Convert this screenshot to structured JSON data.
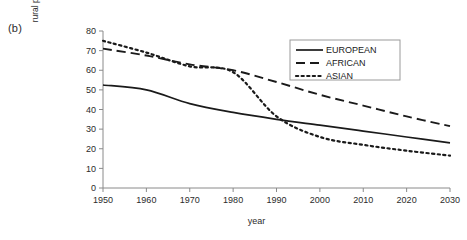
{
  "panel": {
    "label": "(b)"
  },
  "axes": {
    "xlabel": "year",
    "ylabel": "rural population as percentage of total population"
  },
  "legend": {
    "items": [
      {
        "label": "EUROPEAN",
        "style": "solid"
      },
      {
        "label": "AFRICAN",
        "style": "dashed"
      },
      {
        "label": "ASIAN",
        "style": "dotted"
      }
    ]
  },
  "chart_data": {
    "type": "line",
    "title": "",
    "xlabel": "year",
    "ylabel": "rural population as percentage of total population",
    "xlim": [
      1950,
      2030
    ],
    "ylim": [
      0,
      80
    ],
    "xticks": [
      1950,
      1960,
      1970,
      1980,
      1990,
      2000,
      2010,
      2020,
      2030
    ],
    "yticks": [
      0,
      10,
      20,
      30,
      40,
      50,
      60,
      70,
      80
    ],
    "grid": false,
    "legend_position": "top-right",
    "x": [
      1950,
      1960,
      1970,
      1980,
      1990,
      2000,
      2010,
      2020,
      2030
    ],
    "series": [
      {
        "name": "EUROPEAN",
        "style": "solid",
        "color": "#1a1a1a",
        "values": [
          52.5,
          50.0,
          43.0,
          38.5,
          35.0,
          32.0,
          29.0,
          26.0,
          23.0
        ]
      },
      {
        "name": "AFRICAN",
        "style": "dashed",
        "color": "#1a1a1a",
        "values": [
          71.0,
          67.5,
          63.0,
          60.0,
          54.0,
          47.5,
          42.0,
          36.5,
          31.5
        ]
      },
      {
        "name": "ASIAN",
        "style": "dotted",
        "color": "#1a1a1a",
        "values": [
          75.0,
          69.0,
          62.0,
          59.0,
          36.5,
          26.0,
          22.0,
          19.0,
          16.5
        ]
      }
    ]
  }
}
